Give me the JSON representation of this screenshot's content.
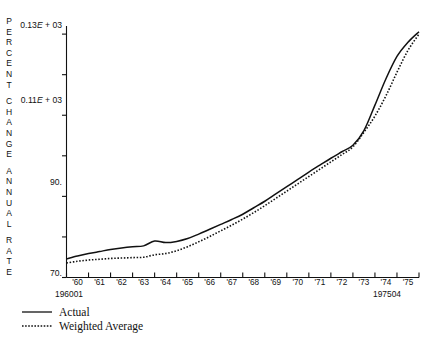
{
  "axis_title": {
    "text": "PERCENT CHANGE ANNUAL RATE",
    "lines": [
      "PERCENT",
      "CHANGE",
      "ANNUAL",
      "RATE"
    ]
  },
  "legend": {
    "items": [
      {
        "label": "Actual",
        "style": "solid",
        "swatch_name": "legend-swatch-solid"
      },
      {
        "label": "Weighted Average",
        "style": "dotted",
        "swatch_name": "legend-swatch-dotted"
      }
    ]
  },
  "corner_labels": {
    "start": "196001",
    "end": "197504"
  },
  "caption": {
    "text": ""
  },
  "chart_data": {
    "type": "line",
    "title": "",
    "subtitle": "",
    "xlabel": "",
    "ylabel": "PERCENT CHANGE ANNUAL RATE",
    "xlim": [
      1960.0,
      1976.0
    ],
    "ylim": [
      70,
      132
    ],
    "grid": false,
    "legend_position": "below-left",
    "y_ticks": [
      70,
      80,
      90,
      100,
      110,
      120,
      130
    ],
    "y_tick_labels": [
      "70.",
      "",
      "90.",
      "",
      "0.11E + 03",
      "",
      "0.13E + 03"
    ],
    "x_ticks": [
      1960,
      1961,
      1962,
      1963,
      1964,
      1965,
      1966,
      1967,
      1968,
      1969,
      1970,
      1971,
      1972,
      1973,
      1974,
      1975
    ],
    "x_tick_labels": [
      "'60",
      "'61",
      "'62",
      "'63",
      "'64",
      "'65",
      "'66",
      "'67",
      "'68",
      "'69",
      "'70",
      "'71",
      "'72",
      "'73",
      "'74",
      "'75"
    ],
    "x": [
      1960.0,
      1960.5,
      1961.0,
      1961.5,
      1962.0,
      1962.5,
      1963.0,
      1963.5,
      1964.0,
      1964.5,
      1965.0,
      1965.5,
      1966.0,
      1966.5,
      1967.0,
      1967.5,
      1968.0,
      1968.5,
      1969.0,
      1969.5,
      1970.0,
      1970.5,
      1971.0,
      1971.5,
      1972.0,
      1972.5,
      1973.0,
      1973.5,
      1974.0,
      1974.5,
      1975.0,
      1975.5,
      1976.0
    ],
    "series": [
      {
        "name": "Actual",
        "style": "solid",
        "values": [
          74.6,
          75.3,
          75.9,
          76.4,
          76.9,
          77.3,
          77.6,
          77.8,
          79.0,
          78.6,
          78.9,
          79.6,
          80.7,
          81.9,
          83.1,
          84.3,
          85.6,
          87.2,
          88.8,
          90.6,
          92.4,
          94.2,
          96.0,
          97.7,
          99.4,
          101.0,
          102.6,
          106.2,
          112.5,
          119.0,
          124.5,
          128.0,
          130.6
        ]
      },
      {
        "name": "Weighted Average",
        "style": "dotted",
        "values": [
          73.6,
          74.0,
          74.3,
          74.5,
          74.7,
          74.8,
          74.9,
          75.0,
          75.6,
          75.9,
          76.6,
          77.6,
          78.8,
          80.1,
          81.5,
          82.9,
          84.4,
          86.0,
          87.7,
          89.5,
          91.3,
          93.1,
          94.9,
          96.7,
          98.5,
          100.3,
          102.2,
          105.8,
          109.8,
          114.8,
          120.6,
          126.0,
          130.0
        ]
      }
    ]
  }
}
